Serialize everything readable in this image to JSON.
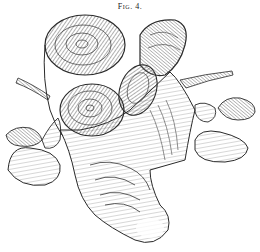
{
  "figure": {
    "caption": "Fig. 4.",
    "style": "black-and-white line engraving",
    "colors": {
      "ink": "#2a2a2a",
      "paper": "#ffffff",
      "shade": "#6a6a6a"
    }
  }
}
